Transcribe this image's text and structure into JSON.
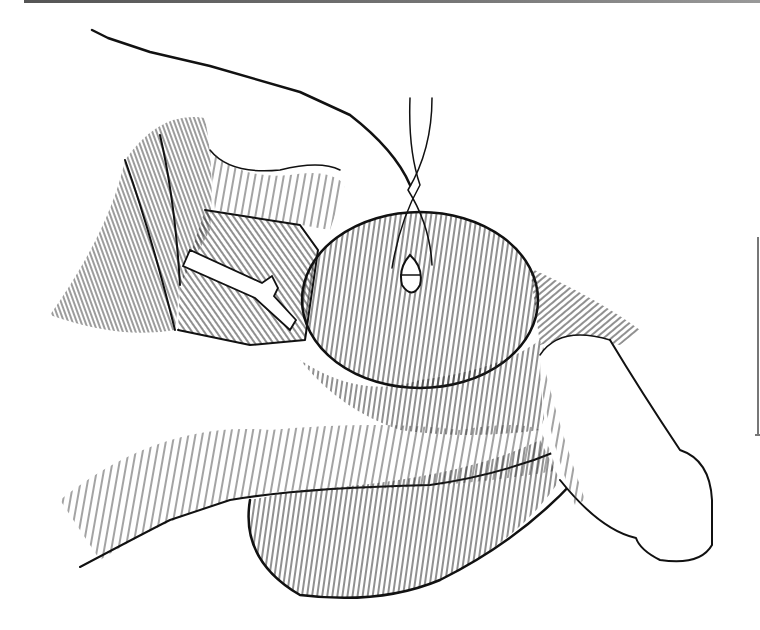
{
  "figure": {
    "type": "medical line illustration",
    "style": "black ink hatching on white",
    "colors": {
      "ink": "#111111",
      "background": "#ffffff",
      "rule": "#777777"
    },
    "elements": [
      "hand-fingers",
      "retracted-tissue-folds",
      "exposed-vessel-channel",
      "testicle-with-incision",
      "suture-threads",
      "lower-scrotal-mass",
      "penile-shaft"
    ]
  }
}
